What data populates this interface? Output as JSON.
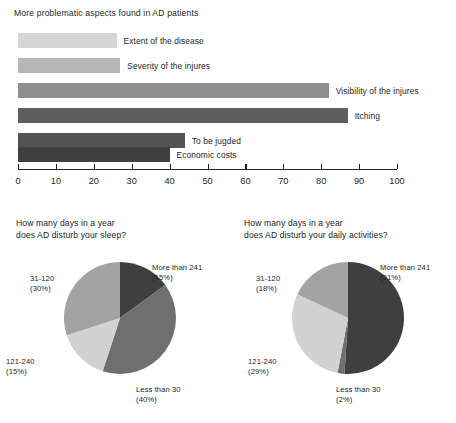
{
  "bar_section": {
    "title": "More problematic aspects found in AD patients"
  },
  "pies": {
    "left": {
      "title_line1": "How many days in a year",
      "title_line2": "does AD disturb your sleep?",
      "labels": {
        "more_than_241": "More than 241",
        "more_than_241_pct": "(15%)",
        "less_than_30": "Less than 30",
        "less_than_30_pct": "(40%)",
        "d121_240": "121-240",
        "d121_240_pct": "(15%)",
        "d31_120": "31-120",
        "d31_120_pct": "(30%)"
      }
    },
    "right": {
      "title_line1": "How many days in a year",
      "title_line2": "does AD disturb your daily activities?",
      "labels": {
        "more_than_241": "More than 241",
        "more_than_241_pct": "(51%)",
        "less_than_30": "Less than 30",
        "less_than_30_pct": "(2%)",
        "d121_240": "121-240",
        "d121_240_pct": "(29%)",
        "d31_120": "31-120",
        "d31_120_pct": "(18%)"
      }
    }
  },
  "chart_data": [
    {
      "type": "bar",
      "orientation": "horizontal",
      "title": "More problematic aspects found in AD patients",
      "xlabel": "",
      "ylabel": "",
      "xlim": [
        0,
        100
      ],
      "xticks": [
        0,
        10,
        20,
        30,
        40,
        50,
        60,
        70,
        80,
        90,
        100
      ],
      "grid": false,
      "legend": "none",
      "categories": [
        "Extent of the disease",
        "Severity of the injures",
        "Visibility of the injures",
        "Itching",
        "To be jugded",
        "Economic costs"
      ],
      "values": [
        26,
        27,
        82,
        87,
        44,
        40
      ],
      "colors": [
        "#d6d6d6",
        "#b5b5b5",
        "#8e8e8e",
        "#5e5e5e",
        "#545454",
        "#3f3f3f"
      ]
    },
    {
      "type": "pie",
      "title": "How many days in a year does AD disturb your sleep?",
      "labels": [
        "More than 241",
        "Less than 30",
        "121-240",
        "31-120"
      ],
      "values": [
        15,
        40,
        15,
        30
      ],
      "value_labels": [
        "(15%)",
        "(40%)",
        "(15%)",
        "(30%)"
      ],
      "colors": [
        "#3f3f3f",
        "#6f6f6f",
        "#d2d2d2",
        "#a3a3a3"
      ],
      "start_angle_deg": 0,
      "direction": "clockwise",
      "legend": "outside-callouts"
    },
    {
      "type": "pie",
      "title": "How many days in a year does AD disturb your daily activities?",
      "labels": [
        "More than 241",
        "Less than 30",
        "121-240",
        "31-120"
      ],
      "values": [
        51,
        2,
        29,
        18
      ],
      "value_labels": [
        "(51%)",
        "(2%)",
        "(29%)",
        "(18%)"
      ],
      "colors": [
        "#3f3f3f",
        "#6f6f6f",
        "#d2d2d2",
        "#a3a3a3"
      ],
      "start_angle_deg": 0,
      "direction": "clockwise",
      "legend": "outside-callouts"
    }
  ]
}
